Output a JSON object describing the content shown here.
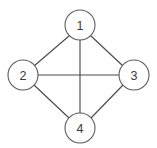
{
  "diagram": {
    "type": "graph",
    "title": "",
    "background_color": "#ffffff",
    "edge_color": "#4a4a4a",
    "node_stroke_color": "#5c5c5c",
    "node_fill_color": "#ffffff",
    "label_color": "#3a3a3a",
    "node_radius": 15,
    "nodes": [
      {
        "id": "1",
        "label": "1",
        "cx": 80,
        "cy": 25
      },
      {
        "id": "2",
        "label": "2",
        "cx": 23,
        "cy": 75
      },
      {
        "id": "3",
        "label": "3",
        "cx": 134,
        "cy": 75
      },
      {
        "id": "4",
        "label": "4",
        "cx": 80,
        "cy": 128
      }
    ],
    "edges": [
      {
        "from": "1",
        "to": "2",
        "x1": 69,
        "y1": 36,
        "x2": 34,
        "y2": 66
      },
      {
        "from": "1",
        "to": "3",
        "x1": 91,
        "y1": 36,
        "x2": 123,
        "y2": 66
      },
      {
        "from": "1",
        "to": "4",
        "x1": 80,
        "y1": 40,
        "x2": 80,
        "y2": 113
      },
      {
        "from": "2",
        "to": "3",
        "x1": 38,
        "y1": 75,
        "x2": 119,
        "y2": 75
      },
      {
        "from": "2",
        "to": "4",
        "x1": 34,
        "y1": 85,
        "x2": 69,
        "y2": 118
      },
      {
        "from": "3",
        "to": "4",
        "x1": 123,
        "y1": 85,
        "x2": 91,
        "y2": 118
      }
    ]
  }
}
